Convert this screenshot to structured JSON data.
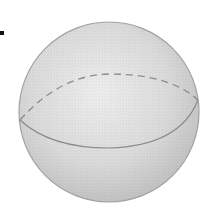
{
  "figure": {
    "colors": {
      "background": "#ffffff",
      "sphere_light": "#ececec",
      "sphere_mid": "#d4d4d4",
      "sphere_dark": "#b8b8b8",
      "outline": "#9a9a9a",
      "equator_line": "#8a8a8a",
      "marker": "#111111"
    }
  }
}
